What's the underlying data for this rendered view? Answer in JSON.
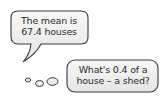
{
  "speech_bubble": {
    "line1": "The mean is",
    "line2": "67.4 houses"
  },
  "thought_bubble": {
    "line1": "What's 0.4 of a",
    "line2": "house – a shed?"
  },
  "colors": {
    "bubble_fill": "#f2f2f2",
    "bubble_stroke": "#3a3a3a",
    "text": "#2b2b2b"
  }
}
